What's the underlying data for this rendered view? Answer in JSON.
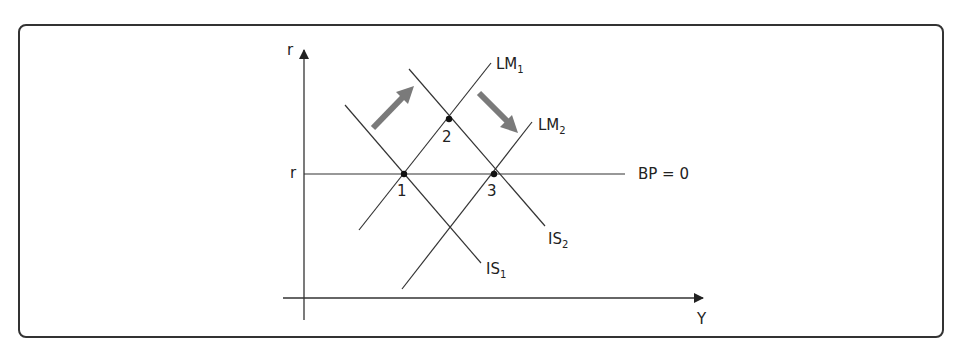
{
  "diagram": {
    "axes": {
      "y_label": "r",
      "x_label": "Y",
      "r_level_label": "r"
    },
    "curves": {
      "bp": {
        "label": "BP = 0"
      },
      "lm1": {
        "label": "LM",
        "sub": "1"
      },
      "lm2": {
        "label": "LM",
        "sub": "2"
      },
      "is1": {
        "label": "IS",
        "sub": "1"
      },
      "is2": {
        "label": "IS",
        "sub": "2"
      }
    },
    "points": [
      {
        "label": "1"
      },
      {
        "label": "2"
      },
      {
        "label": "3"
      }
    ],
    "colors": {
      "line": "#333333",
      "arrow": "#7a7a7a",
      "frame": "#333333"
    }
  }
}
